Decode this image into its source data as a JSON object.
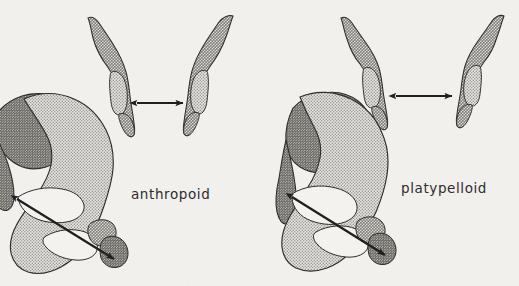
{
  "figure": {
    "kind": "anatomical-illustration",
    "background_color": "#f2f1ee",
    "ink_color": "#2b2b2b"
  },
  "panels": [
    {
      "id": "anthropoid",
      "label": "anthropoid",
      "label_position": {
        "x": 131,
        "y": 199
      },
      "inlet_view": {
        "name": "inlet-view-anthropoid",
        "transverse_arrow": {
          "name": "transverse-diameter-arrow-anthropoid",
          "x1": 137,
          "y1": 103,
          "x2": 183,
          "y2": 103,
          "length_px": 46,
          "style": "double-headed"
        }
      },
      "lateral_view": {
        "name": "lateral-view-anthropoid",
        "oblique_arrow": {
          "name": "oblique-diameter-arrow-anthropoid",
          "x1": 17,
          "y1": 199,
          "x2": 114,
          "y2": 259,
          "length_px": 114,
          "style": "double-headed"
        }
      }
    },
    {
      "id": "platypelloid",
      "label": "platypelloid",
      "label_position": {
        "x": 401,
        "y": 193
      },
      "inlet_view": {
        "name": "inlet-view-platypelloid",
        "transverse_arrow": {
          "name": "transverse-diameter-arrow-platypelloid",
          "x1": 396,
          "y1": 96,
          "x2": 452,
          "y2": 96,
          "length_px": 56,
          "style": "double-headed"
        }
      },
      "lateral_view": {
        "name": "lateral-view-platypelloid",
        "oblique_arrow": {
          "name": "oblique-diameter-arrow-platypelloid",
          "x1": 292,
          "y1": 197,
          "x2": 385,
          "y2": 255,
          "length_px": 110,
          "style": "double-headed"
        }
      }
    }
  ],
  "shading": {
    "bone_light_tone": "#b9b7b2",
    "bone_mid_tone": "#a7a5a0",
    "bone_dark_tone": "#8b8984",
    "outline_color": "#2b2b2b",
    "cavity_fill": "#f4f3f0"
  }
}
